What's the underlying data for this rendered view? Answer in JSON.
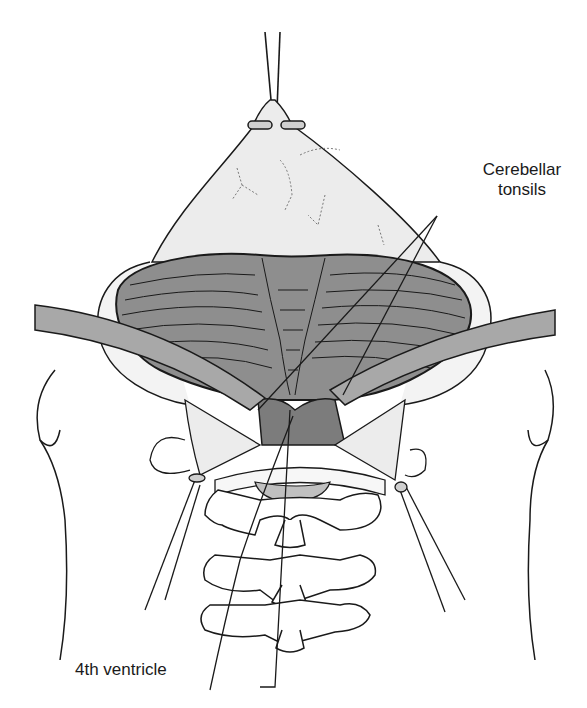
{
  "figure": {
    "colors": {
      "line": "#1a1a1a",
      "cerebellum_fill": "#8e8e8e",
      "retractor_fill": "#a8a8a8",
      "dura_fill": "#ececec",
      "ventricle_fill": "#7c7c7c",
      "background": "#ffffff"
    }
  },
  "labels": {
    "cerebellar_tonsils_line1": "Cerebellar",
    "cerebellar_tonsils_line2": "tonsils",
    "fourth_ventricle": "4th ventricle"
  }
}
